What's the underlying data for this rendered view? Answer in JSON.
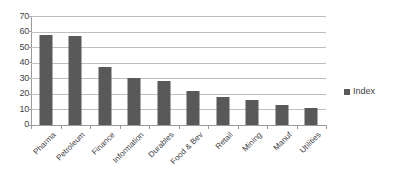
{
  "chart_data": {
    "type": "bar",
    "title": "",
    "subtitle": "",
    "xlabel": "",
    "ylabel": "",
    "categories": [
      "Pharma",
      "Petroleum",
      "Finance",
      "Information",
      "Durables",
      "Food & Bev",
      "Retail",
      "Mining",
      "Manuf",
      "Utilities"
    ],
    "series": [
      {
        "name": "Index",
        "values": [
          58,
          57,
          37,
          30,
          28,
          22,
          18,
          16,
          13,
          11
        ]
      }
    ],
    "ylim": [
      0,
      70
    ],
    "ytick_labels": [
      "70",
      "60",
      "50",
      "40",
      "30",
      "20",
      "10",
      "0"
    ],
    "ytick_values": [
      70,
      60,
      50,
      40,
      30,
      20,
      10,
      0
    ],
    "ystep": 10,
    "grid": "horizontal",
    "legend": {
      "position": "right",
      "entries": [
        {
          "label": "Index",
          "color": "#595959",
          "marker": "square"
        }
      ]
    },
    "colors": {
      "bar": "#595959",
      "gridline": "#bfbfbf",
      "axis": "#9a9a9a",
      "text": "#3f3f3f",
      "background": "#ffffff"
    }
  }
}
